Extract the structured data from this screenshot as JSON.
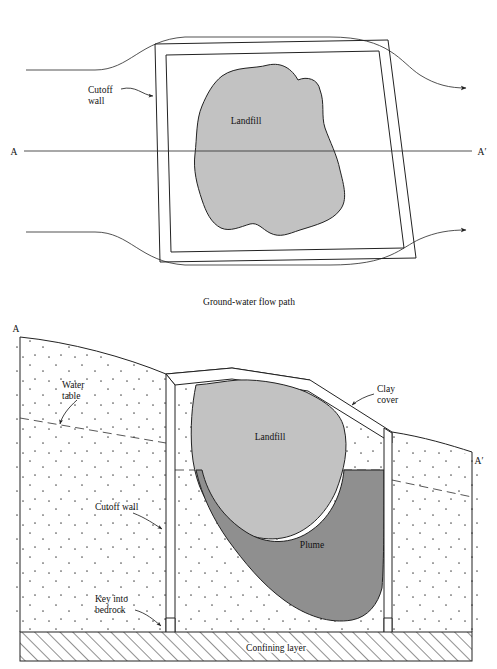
{
  "figure": {
    "type": "engineering-cross-section-and-plan",
    "caption_plan": "Ground-water flow path",
    "colors": {
      "landfill_fill": "#c2c2c2",
      "plume_fill": "#8f8f8f",
      "line": "#222222",
      "background": "#ffffff"
    }
  },
  "plan_view": {
    "section_label_left": "A",
    "section_label_right": "A′",
    "landfill_label": "Landfill",
    "cutoff_wall_label_line1": "Cutoff",
    "cutoff_wall_label_line2": "wall",
    "caption": "Ground-water flow path"
  },
  "cross_section": {
    "section_label_left": "A",
    "section_label_right": "A′",
    "landfill_label": "Landfill",
    "plume_label": "Plume",
    "water_table_label_line1": "Water",
    "water_table_label_line2": "table",
    "clay_cover_label_line1": "Clay",
    "clay_cover_label_line2": "cover",
    "cutoff_wall_label": "Cutoff wall",
    "key_bedrock_label_line1": "Key into",
    "key_bedrock_label_line2": "bedrock",
    "confining_layer_label": "Confining layer"
  }
}
